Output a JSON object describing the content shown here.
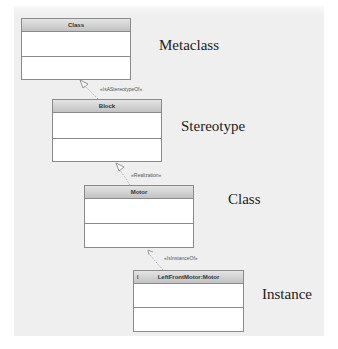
{
  "diagram": {
    "blocks": [
      {
        "id": "class",
        "name": "Class",
        "level_label": "Metaclass"
      },
      {
        "id": "block",
        "name": "Block",
        "level_label": "Stereotype"
      },
      {
        "id": "motor",
        "name": "Motor",
        "level_label": "Class"
      },
      {
        "id": "instance",
        "name": "LeftFrontMotor:Motor",
        "kind_marker": "I",
        "level_label": "Instance"
      }
    ],
    "relationships": [
      {
        "from": "block",
        "to": "class",
        "label": "«IsAStereotypeOf»"
      },
      {
        "from": "motor",
        "to": "block",
        "label": "«Realization»"
      },
      {
        "from": "instance",
        "to": "motor",
        "label": "«IsInstanceOf»"
      }
    ],
    "colors": {
      "header_gradient_top": "#e4e4e4",
      "header_gradient_bottom": "#c2c2c2",
      "border": "#8a8a8a",
      "background": "#efefef"
    }
  }
}
